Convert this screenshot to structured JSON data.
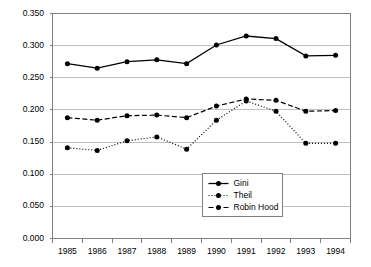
{
  "chart_data": {
    "type": "line",
    "title": "",
    "subtitle": "",
    "xlabel": "",
    "ylabel": "",
    "x": [
      1985,
      1986,
      1987,
      1988,
      1989,
      1990,
      1991,
      1992,
      1993,
      1994
    ],
    "categories": [
      "1985",
      "1986",
      "1987",
      "1988",
      "1989",
      "1990",
      "1991",
      "1992",
      "1993",
      "1994"
    ],
    "series": [
      {
        "name": "Gini",
        "style": "solid",
        "marker": "filled-circle",
        "color": "#000000",
        "values": [
          0.272,
          0.265,
          0.275,
          0.278,
          0.272,
          0.301,
          0.315,
          0.311,
          0.284,
          0.285
        ]
      },
      {
        "name": "Theil",
        "style": "dotted",
        "marker": "filled-circle",
        "color": "#000000",
        "values": [
          0.141,
          0.137,
          0.152,
          0.158,
          0.139,
          0.184,
          0.214,
          0.198,
          0.148,
          0.148
        ]
      },
      {
        "name": "Robin Hood",
        "style": "dashed",
        "marker": "filled-circle",
        "color": "#000000",
        "values": [
          0.188,
          0.184,
          0.191,
          0.192,
          0.188,
          0.206,
          0.217,
          0.215,
          0.198,
          0.199
        ]
      }
    ],
    "ylim": [
      0.0,
      0.35
    ],
    "yticks": [
      0.0,
      0.05,
      0.1,
      0.15,
      0.2,
      0.25,
      0.3,
      0.35
    ],
    "ytick_labels": [
      "0.000",
      "0.050",
      "0.100",
      "0.150",
      "0.200",
      "0.250",
      "0.300",
      "0.350"
    ],
    "xtick_labels": [
      "1985",
      "1986",
      "1987",
      "1988",
      "1989",
      "1990",
      "1991",
      "1992",
      "1993",
      "1994"
    ],
    "grid": {
      "horizontal": true,
      "vertical": false,
      "color": "#c0c0c0"
    },
    "legend": {
      "position": "inside-bottom-center",
      "border": true,
      "entries": [
        "Gini",
        "Theil",
        "Robin Hood"
      ]
    },
    "plot_background": "#ffffff",
    "axis_color": "#808080"
  },
  "legend": {
    "gini_label": "Gini",
    "theil_label": "Theil",
    "robin_hood_label": "Robin Hood"
  },
  "axes": {
    "y_labels": [
      "0.350",
      "0.300",
      "0.250",
      "0.200",
      "0.150",
      "0.100",
      "0.050",
      "0.000"
    ],
    "x_labels": [
      "1985",
      "1986",
      "1987",
      "1988",
      "1989",
      "1990",
      "1991",
      "1992",
      "1993",
      "1994"
    ]
  }
}
